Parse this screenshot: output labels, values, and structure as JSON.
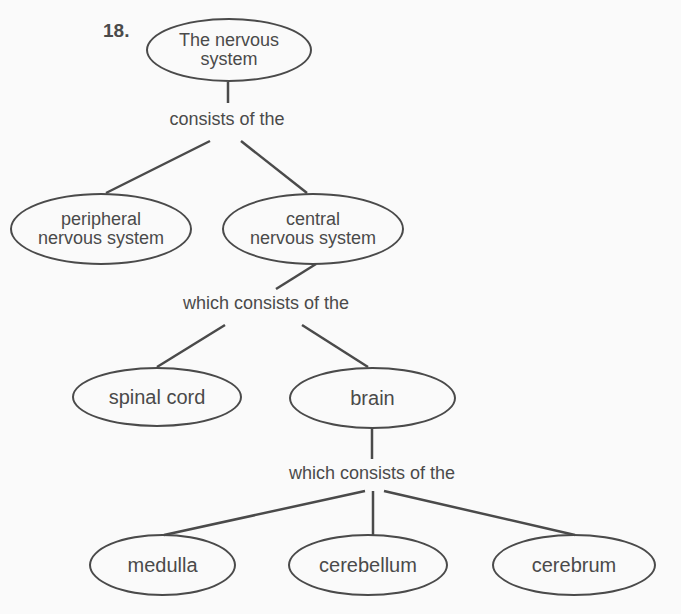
{
  "question_number": "18.",
  "nodes": {
    "nervous_system": "The nervous\nsystem",
    "peripheral": "peripheral\nnervous system",
    "central": "central\nnervous system",
    "spinal_cord": "spinal cord",
    "brain": "brain",
    "medulla": "medulla",
    "cerebellum": "cerebellum",
    "cerebrum": "cerebrum"
  },
  "links": {
    "l1": "consists of the",
    "l2": "which consists of the",
    "l3": "which consists of the"
  },
  "colors": {
    "ink": "#4a4a4a",
    "background": "#fafafa"
  }
}
